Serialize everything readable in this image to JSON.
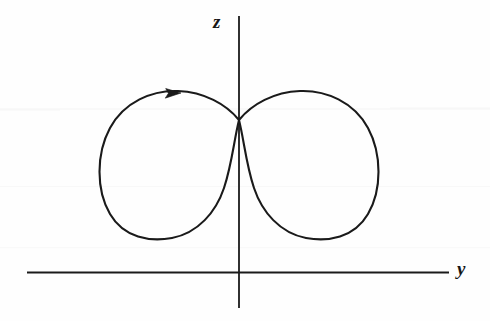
{
  "figure": {
    "kind": "hand-drawn-math-diagram",
    "background_color": "#fefefe",
    "ink_color": "#1a1a1a",
    "axes": {
      "vertical": {
        "label": "z",
        "x": 239,
        "y_top": 16,
        "y_bottom": 308,
        "stroke_width": 1.8
      },
      "horizontal": {
        "label": "y",
        "y": 272,
        "x_left": 27,
        "x_right": 449,
        "stroke_width": 2.0
      }
    },
    "labels": {
      "z_label": "z",
      "y_label": "y"
    },
    "curve": {
      "name": "figure-eight-trajectory",
      "description": "lemniscate-like double loop crossing at the origin-node on the z-axis",
      "node": {
        "x": 239,
        "y": 120
      },
      "left_loop": {
        "left_extent_x": 98,
        "right_extent_x": 240,
        "top_y": 90,
        "bottom_y": 239,
        "center": {
          "x": 169,
          "y": 165
        }
      },
      "right_loop": {
        "left_extent_x": 238,
        "right_extent_x": 383,
        "top_y": 91,
        "bottom_y": 239,
        "center": {
          "x": 311,
          "y": 165
        }
      },
      "stroke_width": 2.1
    },
    "arrow": {
      "name": "direction-arrowhead",
      "tip": {
        "x": 181,
        "y": 93
      },
      "direction": "right",
      "on_branch": "top of left loop",
      "size": 9
    }
  },
  "chart_data": {
    "type": "line",
    "title": "",
    "xlabel": "y",
    "ylabel": "z",
    "grid": false,
    "legend": null,
    "annotations": [
      {
        "text": "direction arrow (clockwise along upper-left branch, pointing +y)",
        "x": 181,
        "y": 93
      }
    ],
    "series": [
      {
        "name": "figure-eight curve",
        "points_note": "closed double loop; self-intersection at the origin on the z-axis; loops symmetric about the z-axis, entirely above the y-axis",
        "x": [
          -1.0,
          -0.95,
          -0.8,
          -0.6,
          -0.4,
          -0.2,
          0.0,
          0.2,
          0.4,
          0.6,
          0.8,
          0.95,
          1.0,
          0.95,
          0.8,
          0.6,
          0.4,
          0.2,
          0.0,
          -0.2,
          -0.4,
          -0.6,
          -0.8,
          -0.95,
          -1.0
        ],
        "y": [
          1.05,
          1.36,
          1.72,
          1.92,
          2.02,
          2.05,
          2.06,
          2.05,
          2.02,
          1.92,
          1.72,
          1.36,
          1.05,
          0.74,
          0.38,
          0.18,
          0.08,
          0.04,
          2.06,
          0.04,
          0.08,
          0.18,
          0.38,
          0.74,
          1.05
        ]
      }
    ],
    "xlim": [
      -1.45,
      2.1
    ],
    "ylim": [
      0.0,
      3.05
    ]
  }
}
